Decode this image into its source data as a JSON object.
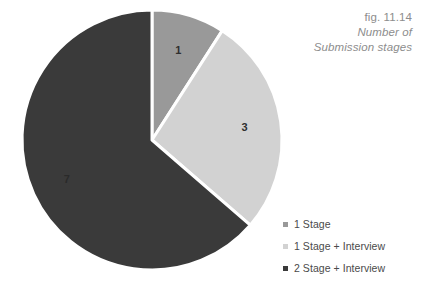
{
  "caption": {
    "figure_number": "fig. 11.14",
    "title_line_1": "Number of",
    "title_line_2": "Submission stages"
  },
  "legend": {
    "items": [
      {
        "label": "1 Stage",
        "color": "#999999",
        "swatch": "square-swatch"
      },
      {
        "label": "1 Stage + Interview",
        "color": "#d2d2d2",
        "swatch": "square-swatch"
      },
      {
        "label": "2 Stage + Interview",
        "color": "#3a3a3a",
        "swatch": "square-swatch"
      }
    ]
  },
  "chart_data": {
    "type": "pie",
    "title": "Number of Submission stages",
    "labels": [
      "1 Stage",
      "1 Stage + Interview",
      "2 Stage + Interview"
    ],
    "values": [
      1,
      3,
      7
    ],
    "value_labels": [
      "1",
      "3",
      "7"
    ],
    "colors": [
      "#999999",
      "#d2d2d2",
      "#3a3a3a"
    ],
    "total": 11,
    "start_angle_deg": 0,
    "direction": "clockwise",
    "legend_position": "bottom-right",
    "grid": false,
    "slice_label_color_light": "#2f2f2f",
    "slice_label_color_dark": "#2a2a2a",
    "separator_color": "#ffffff",
    "geometry": {
      "center_x": 152,
      "center_y": 140,
      "radius": 130,
      "label_radius_factor": 0.72
    }
  }
}
